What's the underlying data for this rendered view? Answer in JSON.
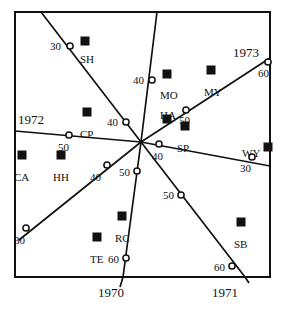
{
  "figure": {
    "type": "scatter-contour-map",
    "background": "#ffffff",
    "ink_color": "#111111",
    "frame": {
      "x": 15,
      "y": 12,
      "width": 255,
      "height": 265
    }
  },
  "axis_labels": [
    {
      "name": "year-1970",
      "text": "1970",
      "x": 98,
      "y": 286
    },
    {
      "name": "year-1971",
      "text": "1971",
      "x": 212,
      "y": 286
    },
    {
      "name": "year-1972",
      "text": "1972",
      "x": 18,
      "y": 113
    },
    {
      "name": "year-1973",
      "text": "1973",
      "x": 233,
      "y": 46
    }
  ],
  "convergence_point": {
    "x": 141,
    "y": 142
  },
  "rays": [
    {
      "name": "ray-sh",
      "x1": 141,
      "y1": 142,
      "x2": 41,
      "y2": 12
    },
    {
      "name": "ray-mo",
      "x1": 141,
      "y1": 142,
      "x2": 157,
      "y2": 12
    },
    {
      "name": "ray-1973",
      "x1": 141,
      "y1": 142,
      "x2": 270,
      "y2": 58
    },
    {
      "name": "ray-wy",
      "x1": 141,
      "y1": 142,
      "x2": 270,
      "y2": 166
    },
    {
      "name": "ray-sb",
      "x1": 141,
      "y1": 142,
      "x2": 245,
      "y2": 277
    },
    {
      "name": "ray-rc",
      "x1": 141,
      "y1": 142,
      "x2": 123,
      "y2": 277
    },
    {
      "name": "ray-te",
      "x1": 141,
      "y1": 142,
      "x2": 19,
      "y2": 240
    },
    {
      "name": "ray-1972",
      "x1": 141,
      "y1": 142,
      "x2": 15,
      "y2": 131
    }
  ],
  "contour_nodes": [
    {
      "name": "node-sh-30",
      "value": "30",
      "cx": 70,
      "cy": 46,
      "lx": 50,
      "ly": 41
    },
    {
      "name": "node-mo-40",
      "value": "40",
      "cx": 152,
      "cy": 80,
      "lx": 133,
      "ly": 75
    },
    {
      "name": "node-1973-60",
      "value": "60",
      "cx": 268,
      "cy": 62,
      "lx": 258,
      "ly": 68
    },
    {
      "name": "node-so-50",
      "value": "50",
      "cx": 186,
      "cy": 110,
      "lx": 179,
      "ly": 115
    },
    {
      "name": "node-cp-40",
      "value": "40",
      "cx": 126,
      "cy": 122,
      "lx": 107,
      "ly": 117
    },
    {
      "name": "node-1972-50",
      "value": "50",
      "cx": 69,
      "cy": 135,
      "lx": 58,
      "ly": 142
    },
    {
      "name": "node-sp-40",
      "value": "40",
      "cx": 159,
      "cy": 144,
      "lx": 152,
      "ly": 151
    },
    {
      "name": "node-wy-30",
      "value": "30",
      "cx": 252,
      "cy": 157,
      "lx": 240,
      "ly": 163
    },
    {
      "name": "node-hh-40",
      "value": "40",
      "cx": 107,
      "cy": 165,
      "lx": 90,
      "ly": 172
    },
    {
      "name": "node-rc-50",
      "value": "50",
      "cx": 137,
      "cy": 171,
      "lx": 119,
      "ly": 167
    },
    {
      "name": "node-sb-50",
      "value": "50",
      "cx": 181,
      "cy": 195,
      "lx": 163,
      "ly": 190
    },
    {
      "name": "node-te-30",
      "value": "30",
      "cx": 26,
      "cy": 228,
      "lx": 14,
      "ly": 235
    },
    {
      "name": "node-rc-60",
      "value": "60",
      "cx": 126,
      "cy": 258,
      "lx": 108,
      "ly": 254
    },
    {
      "name": "node-sb-60",
      "value": "60",
      "cx": 232,
      "cy": 266,
      "lx": 214,
      "ly": 262
    }
  ],
  "stations": [
    {
      "name": "station-sh",
      "code": "SH",
      "mx": 85,
      "my": 41,
      "lx": 80,
      "ly": 54
    },
    {
      "name": "station-mo",
      "code": "MO",
      "mx": 167,
      "my": 74,
      "lx": 160,
      "ly": 90
    },
    {
      "name": "station-my",
      "code": "MY",
      "mx": 211,
      "my": 70,
      "lx": 204,
      "ly": 87
    },
    {
      "name": "station-cp",
      "code": "CP",
      "mx": 87,
      "my": 112,
      "lx": 80,
      "ly": 129
    },
    {
      "name": "station-ha",
      "code": "HA",
      "mx": 167,
      "my": 119,
      "lx": 160,
      "ly": 110
    },
    {
      "name": "station-sp",
      "code": "SP",
      "mx": 185,
      "my": 126,
      "lx": 177,
      "ly": 143
    },
    {
      "name": "station-wy",
      "code": "WY",
      "mx": 268,
      "my": 147,
      "lx": 242,
      "ly": 148
    },
    {
      "name": "station-ca",
      "code": "CA",
      "mx": 22,
      "my": 155,
      "lx": 14,
      "ly": 172
    },
    {
      "name": "station-hh",
      "code": "HH",
      "mx": 61,
      "my": 155,
      "lx": 53,
      "ly": 172
    },
    {
      "name": "station-rc",
      "code": "RC",
      "mx": 122,
      "my": 216,
      "lx": 115,
      "ly": 233
    },
    {
      "name": "station-sb",
      "code": "SB",
      "mx": 241,
      "my": 222,
      "lx": 234,
      "ly": 239
    },
    {
      "name": "station-te",
      "code": "TE",
      "mx": 97,
      "my": 237,
      "lx": 90,
      "ly": 254
    }
  ],
  "chart_data": {
    "type": "scatter",
    "title": "",
    "xlabel": "",
    "ylabel": "",
    "year_boundaries": [
      "1970",
      "1971",
      "1972",
      "1973"
    ],
    "contour_values": [
      30,
      40,
      50,
      60
    ],
    "station_codes": [
      "SH",
      "MO",
      "MY",
      "CP",
      "HA",
      "SP",
      "WY",
      "CA",
      "HH",
      "RC",
      "SB",
      "TE"
    ],
    "grid": false,
    "legend": "none"
  }
}
